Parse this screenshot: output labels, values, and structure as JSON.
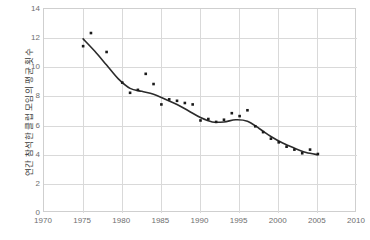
{
  "chart_data": {
    "type": "scatter",
    "title": "",
    "subtitle": "",
    "xlabel": "",
    "ylabel": "연간 참석한 클럽 모임의 평균 횟수",
    "xlim": [
      1970,
      2010
    ],
    "ylim": [
      0,
      14
    ],
    "xticks": [
      1970,
      1975,
      1980,
      1985,
      1990,
      1995,
      2000,
      2005,
      2010
    ],
    "yticks": [
      0,
      2,
      4,
      6,
      8,
      10,
      12,
      14
    ],
    "xtick_step": 5,
    "ytick_step": 2,
    "grid": true,
    "legend": "none",
    "marker_color": "#1a1a1a",
    "line_color": "#2b2b2b",
    "grid_color": "#d9d9d9",
    "axis_color": "#cfcfcf",
    "background": "#ffffff",
    "series": [
      {
        "name": "연간 참석한 클럽 모임의 평균 횟수",
        "type": "scatter",
        "points": [
          {
            "x": 1975,
            "y": 11.45
          },
          {
            "x": 1976,
            "y": 12.35
          },
          {
            "x": 1978,
            "y": 11.05
          },
          {
            "x": 1980,
            "y": 8.95
          },
          {
            "x": 1981,
            "y": 8.25
          },
          {
            "x": 1982,
            "y": 8.45
          },
          {
            "x": 1983,
            "y": 9.55
          },
          {
            "x": 1984,
            "y": 8.85
          },
          {
            "x": 1985,
            "y": 7.45
          },
          {
            "x": 1986,
            "y": 7.8
          },
          {
            "x": 1987,
            "y": 7.7
          },
          {
            "x": 1988,
            "y": 7.55
          },
          {
            "x": 1989,
            "y": 7.45
          },
          {
            "x": 1990,
            "y": 6.35
          },
          {
            "x": 1991,
            "y": 6.45
          },
          {
            "x": 1992,
            "y": 6.25
          },
          {
            "x": 1993,
            "y": 6.4
          },
          {
            "x": 1994,
            "y": 6.85
          },
          {
            "x": 1995,
            "y": 6.65
          },
          {
            "x": 1996,
            "y": 7.05
          },
          {
            "x": 1997,
            "y": 5.95
          },
          {
            "x": 1998,
            "y": 5.55
          },
          {
            "x": 1999,
            "y": 5.1
          },
          {
            "x": 2000,
            "y": 4.85
          },
          {
            "x": 2001,
            "y": 4.55
          },
          {
            "x": 2002,
            "y": 4.35
          },
          {
            "x": 2003,
            "y": 4.1
          },
          {
            "x": 2004,
            "y": 4.35
          },
          {
            "x": 2005,
            "y": 4.05
          }
        ]
      },
      {
        "name": "추세선",
        "type": "line",
        "points": [
          {
            "x": 1975.0,
            "y": 11.95
          },
          {
            "x": 1976.5,
            "y": 11.1
          },
          {
            "x": 1978.0,
            "y": 10.15
          },
          {
            "x": 1979.5,
            "y": 9.2
          },
          {
            "x": 1981.0,
            "y": 8.55
          },
          {
            "x": 1982.5,
            "y": 8.35
          },
          {
            "x": 1984.0,
            "y": 8.15
          },
          {
            "x": 1985.5,
            "y": 7.8
          },
          {
            "x": 1987.0,
            "y": 7.45
          },
          {
            "x": 1988.5,
            "y": 7.0
          },
          {
            "x": 1990.0,
            "y": 6.55
          },
          {
            "x": 1991.5,
            "y": 6.25
          },
          {
            "x": 1993.0,
            "y": 6.25
          },
          {
            "x": 1994.5,
            "y": 6.4
          },
          {
            "x": 1996.0,
            "y": 6.3
          },
          {
            "x": 1997.5,
            "y": 5.8
          },
          {
            "x": 1999.0,
            "y": 5.25
          },
          {
            "x": 2000.5,
            "y": 4.8
          },
          {
            "x": 2002.0,
            "y": 4.45
          },
          {
            "x": 2003.5,
            "y": 4.15
          },
          {
            "x": 2005.0,
            "y": 4.0
          }
        ]
      }
    ]
  }
}
